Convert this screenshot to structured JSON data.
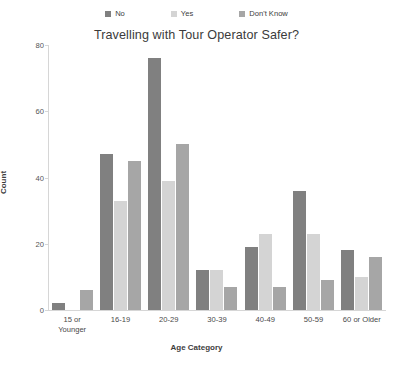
{
  "chart_data": {
    "type": "bar",
    "title": "Travelling with Tour Operator Safer?",
    "xlabel": "Age Category",
    "ylabel": "Count",
    "ylim": [
      0,
      80
    ],
    "yticks": [
      0,
      20,
      40,
      60,
      80
    ],
    "grid": false,
    "legend_position": "top-center",
    "categories": [
      "15 or Younger",
      "16-19",
      "20-29",
      "30-39",
      "40-49",
      "50-59",
      "60 or Older"
    ],
    "series": [
      {
        "name": "No",
        "color": "#808080",
        "values": [
          2,
          47,
          76,
          12,
          19,
          36,
          18
        ]
      },
      {
        "name": "Yes",
        "color": "#d4d4d4",
        "values": [
          0,
          33,
          39,
          12,
          23,
          23,
          10
        ]
      },
      {
        "name": "Don't Know",
        "color": "#a6a6a6",
        "values": [
          6,
          45,
          50,
          7,
          7,
          9,
          16
        ]
      }
    ]
  },
  "legend": {
    "items": [
      {
        "label": "No"
      },
      {
        "label": "Yes"
      },
      {
        "label": "Don't Know"
      }
    ]
  },
  "axis": {
    "y_ticks": [
      "0",
      "20",
      "40",
      "60",
      "80"
    ],
    "x_tick_lines": [
      [
        "15 or",
        "Younger"
      ],
      [
        "16-19",
        ""
      ],
      [
        "20-29",
        ""
      ],
      [
        "30-39",
        ""
      ],
      [
        "40-49",
        ""
      ],
      [
        "50-59",
        ""
      ],
      [
        "60 or Older",
        ""
      ]
    ]
  }
}
